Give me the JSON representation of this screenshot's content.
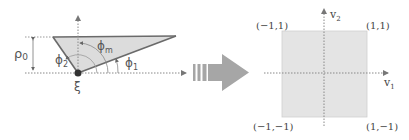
{
  "left_diagram": {
    "labels": {
      "rho": "ρ",
      "rho_sub": "0",
      "phi_m": "ϕ",
      "phi_m_sub": "m",
      "phi_2": "ϕ",
      "phi_2_sub": "2",
      "phi_1": "ϕ",
      "phi_1_sub": "1",
      "xi": "ξ"
    },
    "colors": {
      "triangle_fill": "#dcdcdc",
      "triangle_edge": "#6a6a6a",
      "axis": "#888888",
      "point": "#333333"
    }
  },
  "transform_arrow": {
    "color": "#a6a6a6"
  },
  "right_diagram": {
    "labels": {
      "top_left": "(−1,1)",
      "top_right": "(1,1)",
      "bottom_left": "(−1,−1)",
      "bottom_right": "(1,−1)",
      "v1": "v",
      "v1_sub": "1",
      "v2": "v",
      "v2_sub": "2"
    },
    "colors": {
      "square_fill": "#e4e4e4",
      "square_edge": "#cfcfcf",
      "axis": "#888888"
    }
  }
}
